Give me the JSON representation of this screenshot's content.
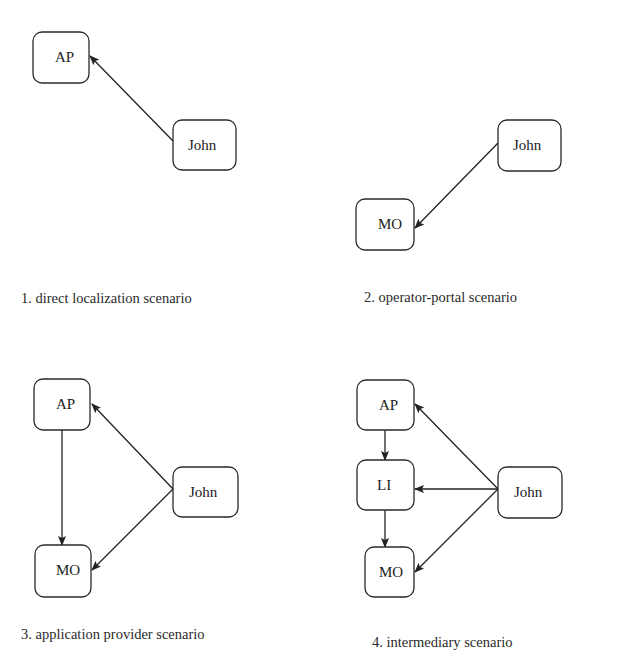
{
  "colors": {
    "stroke": "#2a2a2a",
    "background": "#ffffff",
    "text": "#222222"
  },
  "panels": [
    {
      "caption": "1. direct localization scenario",
      "nodes": [
        {
          "id": "AP",
          "label": "AP"
        },
        {
          "id": "John",
          "label": "John"
        }
      ],
      "edges": [
        {
          "from": "John",
          "to": "AP"
        }
      ]
    },
    {
      "caption": "2. operator-portal scenario",
      "nodes": [
        {
          "id": "John",
          "label": "John"
        },
        {
          "id": "MO",
          "label": "MO"
        }
      ],
      "edges": [
        {
          "from": "John",
          "to": "MO"
        }
      ]
    },
    {
      "caption": "3. application provider scenario",
      "nodes": [
        {
          "id": "AP",
          "label": "AP"
        },
        {
          "id": "MO",
          "label": "MO"
        },
        {
          "id": "John",
          "label": "John"
        }
      ],
      "edges": [
        {
          "from": "John",
          "to": "AP"
        },
        {
          "from": "John",
          "to": "MO"
        },
        {
          "from": "AP",
          "to": "MO"
        }
      ]
    },
    {
      "caption": "4. intermediary scenario",
      "nodes": [
        {
          "id": "AP",
          "label": "AP"
        },
        {
          "id": "LI",
          "label": "LI"
        },
        {
          "id": "MO",
          "label": "MO"
        },
        {
          "id": "John",
          "label": "John"
        }
      ],
      "edges": [
        {
          "from": "John",
          "to": "AP"
        },
        {
          "from": "John",
          "to": "LI"
        },
        {
          "from": "John",
          "to": "MO"
        },
        {
          "from": "AP",
          "to": "LI"
        },
        {
          "from": "LI",
          "to": "MO"
        }
      ]
    }
  ]
}
